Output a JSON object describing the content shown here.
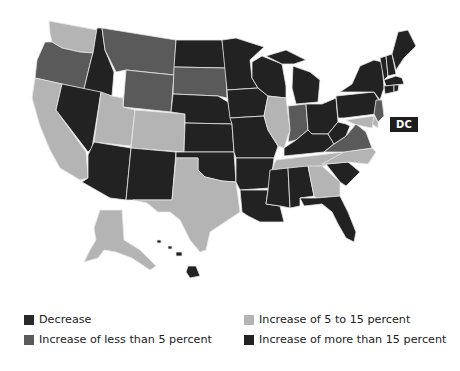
{
  "map": {
    "title": "",
    "label_dc": "DC",
    "categories": {
      "decrease": {
        "label": "Decrease",
        "color": "#2a2a2a"
      },
      "lt5": {
        "label": "Increase of less than 5 percent",
        "color": "#5a5a5a"
      },
      "5to15": {
        "label": "Increase of 5 to 15 percent",
        "color": "#b4b4b4"
      },
      "gt15": {
        "label": "Increase of more than 15 percent",
        "color": "#222222"
      }
    },
    "states": {
      "WA": "5to15",
      "OR": "lt5",
      "CA": "5to15",
      "ID": "gt15",
      "NV": "gt15",
      "MT": "lt5",
      "WY": "lt5",
      "UT": "5to15",
      "CO": "5to15",
      "AZ": "gt15",
      "NM": "gt15",
      "ND": "gt15",
      "SD": "lt5",
      "NE": "gt15",
      "KS": "gt15",
      "OK": "gt15",
      "TX": "5to15",
      "MN": "gt15",
      "IA": "gt15",
      "MO": "gt15",
      "AR": "gt15",
      "LA": "gt15",
      "WI": "gt15",
      "IL": "5to15",
      "MI": "gt15",
      "IN": "lt5",
      "OH": "gt15",
      "KY": "gt15",
      "TN": "5to15",
      "MS": "gt15",
      "AL": "gt15",
      "GA": "5to15",
      "FL": "gt15",
      "SC": "gt15",
      "NC": "5to15",
      "VA": "lt5",
      "WV": "gt15",
      "PA": "gt15",
      "NY": "gt15",
      "VT": "gt15",
      "NH": "gt15",
      "ME": "gt15",
      "MA": "gt15",
      "RI": "gt15",
      "CT": "gt15",
      "NJ": "lt5",
      "DE": "5to15",
      "MD": "5to15",
      "AK": "5to15",
      "HI": "gt15"
    }
  },
  "legend": {
    "items": [
      {
        "label": "Decrease",
        "color": "#2a2a2a"
      },
      {
        "label": "Increase of less than 5 percent",
        "color": "#5a5a5a"
      },
      {
        "label": "Increase of 5 to 15 percent",
        "color": "#b4b4b4"
      },
      {
        "label": "Increase of more than 15 percent",
        "color": "#222222"
      }
    ]
  }
}
